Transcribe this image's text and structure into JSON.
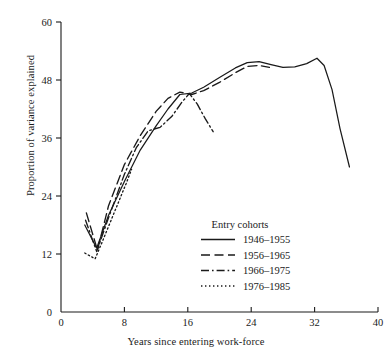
{
  "chart_data": {
    "type": "line",
    "title": "",
    "xlabel": "Years since entering work-force",
    "ylabel": "Proportion of variance explained",
    "xlim": [
      0,
      40
    ],
    "ylim": [
      0,
      60
    ],
    "xticks": [
      0,
      8,
      16,
      24,
      32,
      40
    ],
    "yticks": [
      12,
      24,
      36,
      48,
      60
    ],
    "grid": false,
    "legend_position": "inside-lower-right",
    "legend_title": "Entry cohorts",
    "series": [
      {
        "name": "1946–1955",
        "style": "solid",
        "x": [
          3.0,
          4.5,
          6.0,
          8.0,
          10.0,
          12.0,
          13.5,
          15.0,
          16.5,
          18.0,
          20.0,
          22.0,
          23.5,
          25.0,
          26.5,
          28.0,
          29.5,
          31.0,
          32.3,
          33.2,
          34.2,
          35.2,
          36.4
        ],
        "y": [
          18.0,
          13.2,
          20.0,
          27.0,
          33.5,
          38.5,
          42.0,
          45.0,
          45.3,
          46.5,
          48.5,
          50.5,
          51.6,
          51.8,
          51.2,
          50.6,
          50.7,
          51.4,
          52.5,
          51.0,
          46.0,
          38.0,
          30.0
        ]
      },
      {
        "name": "1956–1965",
        "style": "dashed",
        "x": [
          3.2,
          4.6,
          6.0,
          8.0,
          10.0,
          12.0,
          13.5,
          15.0,
          16.5,
          18.0,
          20.0,
          22.0,
          23.5,
          25.0,
          26.3
        ],
        "y": [
          20.5,
          12.8,
          22.0,
          30.5,
          36.5,
          41.5,
          44.2,
          45.5,
          45.0,
          45.8,
          47.5,
          49.5,
          50.8,
          51.0,
          50.6
        ]
      },
      {
        "name": "1966–1975",
        "style": "dashdot",
        "x": [
          3.1,
          4.5,
          6.0,
          8.0,
          9.5,
          11.0,
          12.5,
          14.0,
          15.3,
          16.2,
          17.2,
          18.2,
          19.2
        ],
        "y": [
          19.0,
          12.5,
          19.5,
          28.5,
          34.0,
          37.5,
          38.2,
          40.5,
          43.5,
          45.2,
          43.0,
          40.0,
          37.3
        ]
      },
      {
        "name": "1976–1985",
        "style": "dotted",
        "x": [
          3.0,
          4.3,
          5.2,
          6.2,
          7.2,
          8.2,
          8.9
        ],
        "y": [
          12.2,
          11.0,
          14.5,
          18.5,
          22.5,
          26.5,
          29.5
        ]
      }
    ]
  },
  "axes": {
    "x_tick_labels": [
      "0",
      "8",
      "16",
      "24",
      "32",
      "40"
    ],
    "y_tick_labels": [
      "12",
      "24",
      "36",
      "48",
      "60"
    ],
    "origin_label": "0"
  },
  "legend": {
    "title": "Entry cohorts",
    "entries": [
      {
        "label": "1946–1955",
        "style": "solid"
      },
      {
        "label": "1956–1965",
        "style": "dashed"
      },
      {
        "label": "1966–1975",
        "style": "dashdot"
      },
      {
        "label": "1976–1985",
        "style": "dotted"
      }
    ]
  },
  "colors": {
    "ink": "#1a1a1a",
    "background": "#ffffff"
  }
}
